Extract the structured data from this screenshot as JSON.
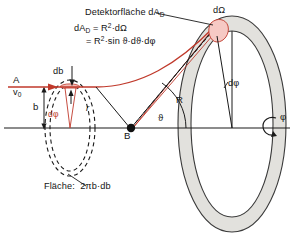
{
  "figure": {
    "title_caption": "Detektorfläche dA",
    "title_caption_sub": "D",
    "equations": {
      "line1_lhs": "dA",
      "line1_lhs_sub": "D",
      "line1_rhs_pre": " = R",
      "line1_exp": "2",
      "line1_rhs_post": "·dΩ",
      "line2_pre": "= R",
      "line2_exp": "2",
      "line2_post": "·sin ϑ·dϑ·dφ"
    },
    "labels": {
      "solid_angle": "dΩ",
      "source_point": "A",
      "initial_velocity": "v",
      "initial_velocity_sub": "0",
      "impact_parameter_differential": "db",
      "impact_parameter": "b",
      "azimuth_differential_left": "dφ",
      "distance_r": "r",
      "scattering_center": "B",
      "scattering_angle": "ϑ",
      "detector_radius": "R",
      "azimuth_differential_right": "dφ",
      "azimuth_angle": "φ"
    },
    "area_caption": {
      "prefix": "Fläche:",
      "value": "2πb·db"
    },
    "colors": {
      "trajectory": "#c0392b",
      "patch_fill": "#f6c9c4",
      "ring_fill": "#e2e1dd",
      "ring_stroke": "#3a3a3a",
      "axis": "#1a1a1a",
      "text": "#141414"
    }
  }
}
